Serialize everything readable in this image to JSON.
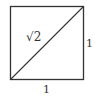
{
  "diagram": {
    "type": "unit-square-with-diagonal",
    "square": {
      "x": 10,
      "y": 6,
      "size": 73,
      "stroke": "#333333"
    },
    "diagonal": {
      "from": "bottom-left",
      "to": "top-right",
      "stroke": "#333333"
    },
    "labels": {
      "diagonal": "√2",
      "bottom_side": "1",
      "right_side": "1"
    }
  }
}
